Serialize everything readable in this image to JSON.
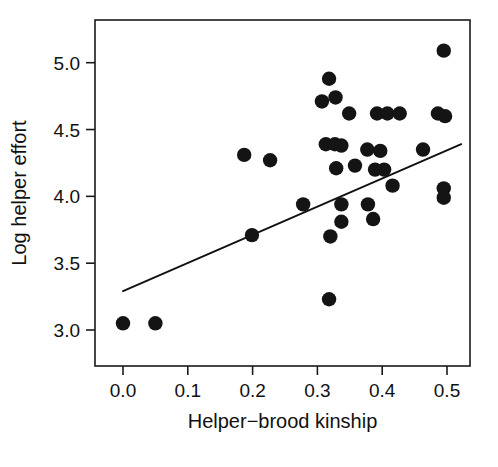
{
  "chart_data": {
    "type": "scatter",
    "title": "",
    "xlabel": "Helper−brood kinship",
    "ylabel": "Log helper effort",
    "xlim": [
      -0.035,
      0.535
    ],
    "ylim": [
      2.78,
      5.22
    ],
    "xticks": [
      0.0,
      0.1,
      0.2,
      0.3,
      0.4,
      0.5
    ],
    "xticklabels": [
      "0.0",
      "0.1",
      "0.2",
      "0.3",
      "0.4",
      "0.5"
    ],
    "yticks": [
      3.0,
      3.5,
      4.0,
      4.5,
      5.0
    ],
    "yticklabels": [
      "3.0",
      "3.5",
      "4.0",
      "4.5",
      "5.0"
    ],
    "grid": false,
    "legend": null,
    "marker": "filled-circle",
    "marker_color": "#141414",
    "marker_size": 7.2,
    "points": [
      {
        "x": 0.0,
        "y": 3.05
      },
      {
        "x": 0.05,
        "y": 3.05
      },
      {
        "x": 0.187,
        "y": 4.31
      },
      {
        "x": 0.199,
        "y": 3.71
      },
      {
        "x": 0.227,
        "y": 4.27
      },
      {
        "x": 0.278,
        "y": 3.94
      },
      {
        "x": 0.307,
        "y": 4.71
      },
      {
        "x": 0.313,
        "y": 4.39
      },
      {
        "x": 0.318,
        "y": 4.88
      },
      {
        "x": 0.318,
        "y": 3.23
      },
      {
        "x": 0.32,
        "y": 3.7
      },
      {
        "x": 0.327,
        "y": 4.39
      },
      {
        "x": 0.328,
        "y": 4.74
      },
      {
        "x": 0.329,
        "y": 4.21
      },
      {
        "x": 0.337,
        "y": 4.38
      },
      {
        "x": 0.337,
        "y": 3.94
      },
      {
        "x": 0.337,
        "y": 3.81
      },
      {
        "x": 0.349,
        "y": 4.62
      },
      {
        "x": 0.358,
        "y": 4.23
      },
      {
        "x": 0.377,
        "y": 4.35
      },
      {
        "x": 0.378,
        "y": 3.94
      },
      {
        "x": 0.386,
        "y": 3.83
      },
      {
        "x": 0.389,
        "y": 4.2
      },
      {
        "x": 0.392,
        "y": 4.62
      },
      {
        "x": 0.397,
        "y": 4.34
      },
      {
        "x": 0.403,
        "y": 4.2
      },
      {
        "x": 0.408,
        "y": 4.62
      },
      {
        "x": 0.416,
        "y": 4.08
      },
      {
        "x": 0.427,
        "y": 4.62
      },
      {
        "x": 0.463,
        "y": 4.35
      },
      {
        "x": 0.486,
        "y": 4.62
      },
      {
        "x": 0.495,
        "y": 5.09
      },
      {
        "x": 0.495,
        "y": 4.06
      },
      {
        "x": 0.495,
        "y": 3.99
      },
      {
        "x": 0.497,
        "y": 4.6
      }
    ],
    "fit_line": {
      "type": "linear-regression",
      "x_start": 0.0,
      "y_start": 3.29,
      "x_end": 0.522,
      "y_end": 4.39,
      "slope": 2.11,
      "intercept": 3.29,
      "color": "#111111"
    }
  }
}
